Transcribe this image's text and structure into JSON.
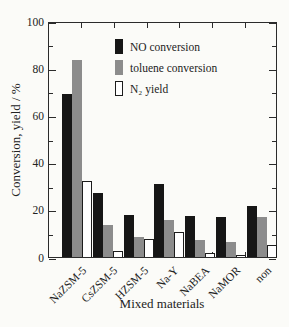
{
  "figure": {
    "background": "#fbfbf8",
    "frame_color": "#2b2b2b",
    "bar_black": "#161616",
    "bar_gray": "#8c8c8c",
    "bar_white": "#ffffff"
  },
  "chart_data": {
    "type": "bar",
    "title": "",
    "xlabel": "Mixed materials",
    "ylabel": "Conversion, yield / %",
    "ylim": [
      0,
      100
    ],
    "y_major_ticks": [
      0,
      20,
      40,
      60,
      80,
      100
    ],
    "y_minor_ticks": [
      10,
      30,
      50,
      70,
      90
    ],
    "grid": false,
    "legend_position": "upper inside",
    "categories": [
      "NaZSM-5",
      "CsZSM-5",
      "HZSM-5",
      "Na-Y",
      "NaBEA",
      "NaMOR",
      "non"
    ],
    "series": [
      {
        "name": "NO conversion",
        "color": "#161616",
        "fill": "solid",
        "values": [
          69,
          27,
          18,
          31,
          17.5,
          17,
          21.5
        ]
      },
      {
        "name": "toluene conversion",
        "color": "#8c8c8c",
        "fill": "solid",
        "values": [
          83.5,
          13.5,
          8.5,
          15.5,
          7,
          6.5,
          17
        ]
      },
      {
        "name": "N₂ yield",
        "color": "#ffffff",
        "fill": "outlined",
        "values": [
          32,
          2.5,
          7.5,
          10.5,
          1.5,
          1,
          5
        ]
      }
    ]
  }
}
